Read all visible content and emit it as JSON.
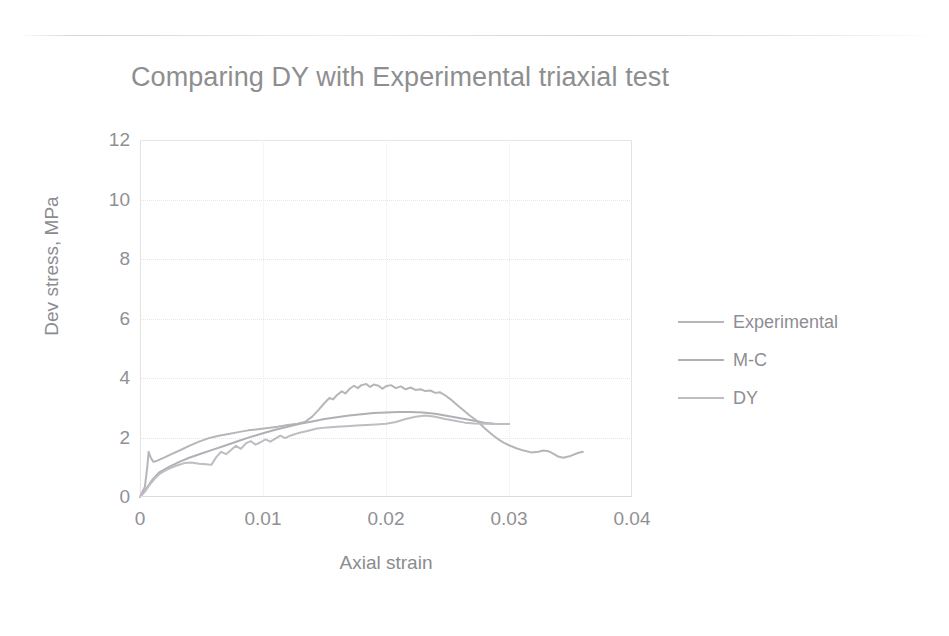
{
  "chart_data": {
    "type": "line",
    "title": "Comparing DY with Experimental triaxial test",
    "xlabel": "Axial strain",
    "ylabel": "Dev stress, MPa",
    "xlim": [
      0,
      0.04
    ],
    "ylim": [
      0,
      12
    ],
    "xticks": [
      "0",
      "0.01",
      "0.02",
      "0.03",
      "0.04"
    ],
    "xtick_values": [
      0,
      0.01,
      0.02,
      0.03,
      0.04
    ],
    "yticks": [
      "0",
      "2",
      "4",
      "6",
      "8",
      "10",
      "12"
    ],
    "ytick_values": [
      0,
      2,
      4,
      6,
      8,
      10,
      12
    ],
    "grid": true,
    "legend_position": "right",
    "series": [
      {
        "name": "Experimental",
        "color": "#b6b6ba",
        "points": [
          [
            0.0,
            0.0
          ],
          [
            0.0004,
            0.35
          ],
          [
            0.0006,
            1.05
          ],
          [
            0.0007,
            1.52
          ],
          [
            0.0009,
            1.3
          ],
          [
            0.0011,
            1.18
          ],
          [
            0.0014,
            1.22
          ],
          [
            0.002,
            1.33
          ],
          [
            0.0026,
            1.45
          ],
          [
            0.0033,
            1.58
          ],
          [
            0.004,
            1.72
          ],
          [
            0.0048,
            1.86
          ],
          [
            0.0056,
            1.98
          ],
          [
            0.0064,
            2.06
          ],
          [
            0.0072,
            2.12
          ],
          [
            0.008,
            2.18
          ],
          [
            0.0088,
            2.24
          ],
          [
            0.0096,
            2.28
          ],
          [
            0.0104,
            2.32
          ],
          [
            0.0112,
            2.36
          ],
          [
            0.012,
            2.42
          ],
          [
            0.0128,
            2.46
          ],
          [
            0.0134,
            2.52
          ],
          [
            0.014,
            2.7
          ],
          [
            0.0145,
            2.92
          ],
          [
            0.015,
            3.16
          ],
          [
            0.0154,
            3.33
          ],
          [
            0.0157,
            3.28
          ],
          [
            0.016,
            3.42
          ],
          [
            0.0164,
            3.55
          ],
          [
            0.0167,
            3.48
          ],
          [
            0.017,
            3.62
          ],
          [
            0.0174,
            3.74
          ],
          [
            0.0177,
            3.66
          ],
          [
            0.018,
            3.76
          ],
          [
            0.0184,
            3.8
          ],
          [
            0.0187,
            3.7
          ],
          [
            0.019,
            3.78
          ],
          [
            0.0194,
            3.74
          ],
          [
            0.0197,
            3.64
          ],
          [
            0.02,
            3.72
          ],
          [
            0.0204,
            3.76
          ],
          [
            0.0208,
            3.66
          ],
          [
            0.0212,
            3.72
          ],
          [
            0.0216,
            3.62
          ],
          [
            0.022,
            3.68
          ],
          [
            0.0224,
            3.6
          ],
          [
            0.0228,
            3.62
          ],
          [
            0.0232,
            3.56
          ],
          [
            0.0236,
            3.58
          ],
          [
            0.024,
            3.5
          ],
          [
            0.0244,
            3.52
          ],
          [
            0.0248,
            3.42
          ],
          [
            0.0252,
            3.3
          ],
          [
            0.0256,
            3.16
          ],
          [
            0.026,
            3.02
          ],
          [
            0.0264,
            2.88
          ],
          [
            0.0268,
            2.74
          ],
          [
            0.0272,
            2.62
          ],
          [
            0.0276,
            2.48
          ],
          [
            0.028,
            2.32
          ],
          [
            0.0284,
            2.18
          ],
          [
            0.0288,
            2.04
          ],
          [
            0.0292,
            1.92
          ],
          [
            0.0296,
            1.82
          ],
          [
            0.03,
            1.74
          ],
          [
            0.0306,
            1.64
          ],
          [
            0.0312,
            1.56
          ],
          [
            0.0318,
            1.5
          ],
          [
            0.0324,
            1.52
          ],
          [
            0.0328,
            1.56
          ],
          [
            0.0332,
            1.54
          ],
          [
            0.0336,
            1.46
          ],
          [
            0.034,
            1.36
          ],
          [
            0.0344,
            1.32
          ],
          [
            0.035,
            1.38
          ],
          [
            0.0356,
            1.48
          ],
          [
            0.036,
            1.52
          ]
        ]
      },
      {
        "name": "M-C",
        "color": "#b0b0b5",
        "points": [
          [
            0.0,
            0.0
          ],
          [
            0.0004,
            0.22
          ],
          [
            0.001,
            0.58
          ],
          [
            0.0016,
            0.84
          ],
          [
            0.0024,
            1.02
          ],
          [
            0.0032,
            1.18
          ],
          [
            0.004,
            1.32
          ],
          [
            0.005,
            1.46
          ],
          [
            0.006,
            1.6
          ],
          [
            0.007,
            1.74
          ],
          [
            0.008,
            1.88
          ],
          [
            0.009,
            2.02
          ],
          [
            0.01,
            2.14
          ],
          [
            0.011,
            2.26
          ],
          [
            0.012,
            2.36
          ],
          [
            0.013,
            2.46
          ],
          [
            0.014,
            2.54
          ],
          [
            0.015,
            2.62
          ],
          [
            0.016,
            2.68
          ],
          [
            0.017,
            2.74
          ],
          [
            0.018,
            2.78
          ],
          [
            0.019,
            2.82
          ],
          [
            0.02,
            2.84
          ],
          [
            0.021,
            2.86
          ],
          [
            0.022,
            2.86
          ],
          [
            0.023,
            2.84
          ],
          [
            0.024,
            2.8
          ],
          [
            0.0248,
            2.74
          ],
          [
            0.0256,
            2.68
          ],
          [
            0.0264,
            2.62
          ],
          [
            0.0272,
            2.56
          ],
          [
            0.028,
            2.5
          ],
          [
            0.0288,
            2.46
          ],
          [
            0.0296,
            2.45
          ],
          [
            0.03,
            2.45
          ]
        ]
      },
      {
        "name": "DY",
        "color": "#bdbdc2",
        "points": [
          [
            0.0,
            0.0
          ],
          [
            0.0004,
            0.18
          ],
          [
            0.0008,
            0.42
          ],
          [
            0.0012,
            0.62
          ],
          [
            0.0016,
            0.78
          ],
          [
            0.002,
            0.88
          ],
          [
            0.0025,
            0.98
          ],
          [
            0.003,
            1.06
          ],
          [
            0.0036,
            1.14
          ],
          [
            0.0042,
            1.16
          ],
          [
            0.0048,
            1.12
          ],
          [
            0.0054,
            1.1
          ],
          [
            0.0058,
            1.08
          ],
          [
            0.0062,
            1.34
          ],
          [
            0.0066,
            1.52
          ],
          [
            0.007,
            1.44
          ],
          [
            0.0074,
            1.58
          ],
          [
            0.0078,
            1.72
          ],
          [
            0.0082,
            1.62
          ],
          [
            0.0086,
            1.8
          ],
          [
            0.009,
            1.88
          ],
          [
            0.0094,
            1.76
          ],
          [
            0.0098,
            1.84
          ],
          [
            0.0102,
            1.94
          ],
          [
            0.0106,
            1.86
          ],
          [
            0.011,
            1.96
          ],
          [
            0.0114,
            2.06
          ],
          [
            0.0118,
            1.98
          ],
          [
            0.0122,
            2.06
          ],
          [
            0.0128,
            2.14
          ],
          [
            0.0136,
            2.22
          ],
          [
            0.0144,
            2.3
          ],
          [
            0.0152,
            2.34
          ],
          [
            0.016,
            2.36
          ],
          [
            0.0168,
            2.38
          ],
          [
            0.0176,
            2.4
          ],
          [
            0.0184,
            2.42
          ],
          [
            0.0192,
            2.44
          ],
          [
            0.02,
            2.46
          ],
          [
            0.0208,
            2.52
          ],
          [
            0.0216,
            2.62
          ],
          [
            0.0224,
            2.7
          ],
          [
            0.0232,
            2.74
          ],
          [
            0.024,
            2.7
          ],
          [
            0.0248,
            2.62
          ],
          [
            0.0256,
            2.56
          ],
          [
            0.0264,
            2.5
          ],
          [
            0.0272,
            2.47
          ],
          [
            0.028,
            2.46
          ],
          [
            0.029,
            2.45
          ],
          [
            0.03,
            2.45
          ]
        ]
      }
    ]
  },
  "legend": {
    "items": [
      {
        "label": "Experimental"
      },
      {
        "label": "M-C"
      },
      {
        "label": "DY"
      }
    ]
  }
}
